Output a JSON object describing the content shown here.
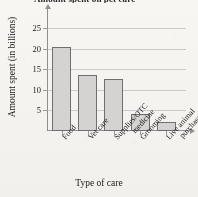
{
  "chart_data": {
    "type": "bar",
    "title": "Amount spent on pet care",
    "xlabel": "Type of care",
    "ylabel": "Amount spent (in billions)",
    "categories": [
      "Food",
      "Vet care",
      "Supplies/OTC medicine",
      "Grooming",
      "Live animal purchase"
    ],
    "category_lines": [
      [
        "Food"
      ],
      [
        "Vet care"
      ],
      [
        "Supplies/OTC",
        "medicine"
      ],
      [
        "Grooming"
      ],
      [
        "Live animal",
        "purchase"
      ]
    ],
    "values": [
      20.5,
      13.6,
      12.6,
      4.2,
      2.1
    ],
    "ylim": [
      0,
      27
    ],
    "yticks": [
      5,
      10,
      15,
      20,
      25
    ],
    "ytick_labels": [
      "5",
      "10",
      "15",
      "20",
      "25"
    ],
    "grid": "horizontal",
    "legend": "none",
    "bar_fill": "#d2d1cf",
    "bar_edge": "#6f6f6f",
    "grid_color": "#c9c9c9",
    "axis_color": "#8f8f8f"
  }
}
